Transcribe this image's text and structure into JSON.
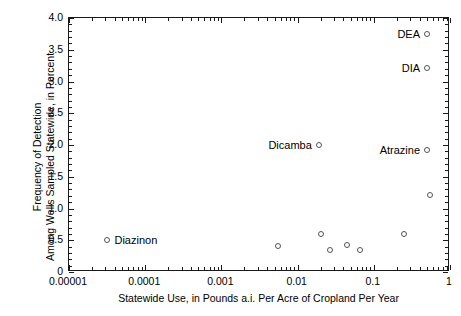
{
  "chart_data": {
    "type": "scatter",
    "title": "",
    "xlabel": "Statewide Use, in Pounds a.i. Per Acre of Cropland Per Year",
    "ylabel_lines": [
      "Frequency of Detection",
      "Among Wells Sampled Statewide, in Percent"
    ],
    "xscale": "log",
    "yscale": "linear",
    "xlim": [
      1e-05,
      1
    ],
    "ylim": [
      0,
      4.0
    ],
    "grid": false,
    "legend": "none",
    "xticks": [
      "0.00001",
      "0.0001",
      "0.001",
      "0.01",
      "0.1",
      "1"
    ],
    "xtick_values": [
      1e-05,
      0.0001,
      0.001,
      0.01,
      0.1,
      1
    ],
    "yticks": [
      "0",
      "0.5",
      "1.0",
      "1.5",
      "2.0",
      "2.5",
      "3.0",
      "3.5",
      "4.0"
    ],
    "ytick_values": [
      0,
      0.5,
      1.0,
      1.5,
      2.0,
      2.5,
      3.0,
      3.5,
      4.0
    ],
    "marker": "open-circle",
    "marker_color": "#555555",
    "axis_color": "#1a1a1a",
    "background": "#ffffff",
    "points": [
      {
        "label": "Diazinon",
        "x": 3.2e-05,
        "y": 0.5,
        "label_pos": "right"
      },
      {
        "label": "Dicamba",
        "x": 0.019,
        "y": 2.0,
        "label_pos": "left"
      },
      {
        "label": "Atrazine",
        "x": 0.5,
        "y": 1.92,
        "label_pos": "left"
      },
      {
        "label": "DEA",
        "x": 0.5,
        "y": 3.75,
        "label_pos": "left"
      },
      {
        "label": "DIA",
        "x": 0.5,
        "y": 3.22,
        "label_pos": "left"
      },
      {
        "label": "",
        "x": 0.0055,
        "y": 0.41,
        "label_pos": "none"
      },
      {
        "label": "",
        "x": 0.02,
        "y": 0.6,
        "label_pos": "none"
      },
      {
        "label": "",
        "x": 0.027,
        "y": 0.34,
        "label_pos": "none"
      },
      {
        "label": "",
        "x": 0.045,
        "y": 0.42,
        "label_pos": "none"
      },
      {
        "label": "",
        "x": 0.065,
        "y": 0.35,
        "label_pos": "none"
      },
      {
        "label": "",
        "x": 0.25,
        "y": 0.6,
        "label_pos": "none"
      },
      {
        "label": "",
        "x": 0.55,
        "y": 1.21,
        "label_pos": "none"
      }
    ]
  }
}
